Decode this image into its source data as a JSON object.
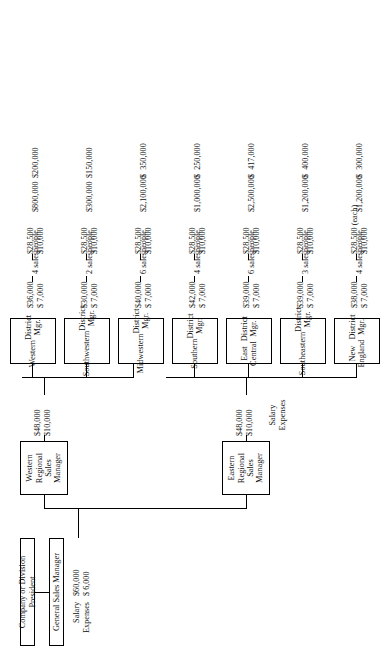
{
  "chart_data": {
    "type": "diagram",
    "orientation": "page rotated 90 degrees counter-clockwise",
    "top": {
      "president": "Company or Division President",
      "general_sales_manager": "General Sales Manager",
      "gsm_salary_label": "Salary",
      "gsm_expenses_label": "Expenses",
      "gsm_salary": "$60,000",
      "gsm_expenses": "$ 6,000"
    },
    "regions": [
      {
        "name": "Eastern Regional\nSales Manager",
        "salary_label": "Salary",
        "expenses_label": "Expenses",
        "salary": "$48,000",
        "expenses": "$10,000"
      },
      {
        "name": "Western Regional\nSales Manager",
        "salary_label": "Salary",
        "expenses_label": "Expenses",
        "salary": "$48,000",
        "expenses": "$10,000"
      }
    ],
    "row_labels": [
      "Salary\nExpenses",
      "Salary\nExpenses",
      "Sales",
      "Average\nper salesperson"
    ],
    "districts": [
      {
        "name": "New England\nDistrict Mgr.",
        "region": "Eastern",
        "mgr_salary": "$38,000",
        "mgr_expenses": "$ 7,000",
        "salespeople": "4 salespeople",
        "sp_salary": "$28,500 (each)",
        "sp_expenses": "$10,000",
        "sales": "$1,200,000",
        "avg_per_salesperson": "$  300,000"
      },
      {
        "name": "Southeastern\nDistrict Mgr.",
        "region": "Eastern",
        "mgr_salary": "$39,000",
        "mgr_expenses": "$ 7,000",
        "salespeople": "3 salespeople",
        "sp_salary": "$28,500",
        "sp_expenses": "$10,000",
        "sales": "$1,200,000",
        "avg_per_salesperson": "$  400,000"
      },
      {
        "name": "East Central\nDistrict Mgr.",
        "region": "Eastern",
        "mgr_salary": "$39,000",
        "mgr_expenses": "$ 7,000",
        "salespeople": "6 salespeople",
        "sp_salary": "$28,500",
        "sp_expenses": "$10,000",
        "sales": "$2,500,000",
        "avg_per_salesperson": "$  417,000"
      },
      {
        "name": "Southern\nDistrict Mgr.",
        "region": "Eastern",
        "mgr_salary": "$42,000",
        "mgr_expenses": "$ 7,000",
        "salespeople": "4 salespeople",
        "sp_salary": "$28,500",
        "sp_expenses": "$10,000",
        "sales": "$1,000,000",
        "avg_per_salesperson": "$  250,000"
      },
      {
        "name": "Midwestern\nDistrict Mgr.",
        "region": "Western",
        "mgr_salary": "$40,000",
        "mgr_expenses": "$ 7,000",
        "salespeople": "6 salespeople",
        "sp_salary": "$28,500",
        "sp_expenses": "$10,000",
        "sales": "$2,100,000",
        "avg_per_salesperson": "$  350,000"
      },
      {
        "name": "Southwestern\nDistrict Mgr.",
        "region": "Western",
        "mgr_salary": "$30,000",
        "mgr_expenses": "$ 7,000",
        "salespeople": "2 salespeople",
        "sp_salary": "$28,500",
        "sp_expenses": "$10,000",
        "sales": "$300,000",
        "avg_per_salesperson": "$150,000"
      },
      {
        "name": "Western\nDistrict Mgr.",
        "region": "Western",
        "mgr_salary": "$36,000",
        "mgr_expenses": "$ 7,000",
        "salespeople": "4 salespeople",
        "sp_salary": "$28,500",
        "sp_expenses": "$10,000",
        "sales": "$800,000",
        "avg_per_salesperson": "$200,000"
      }
    ]
  }
}
